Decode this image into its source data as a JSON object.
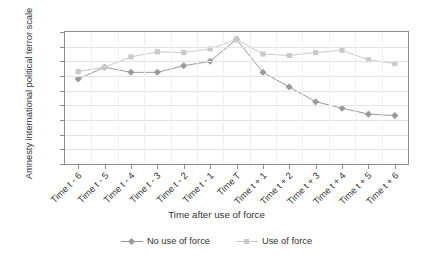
{
  "chart_data": {
    "type": "line",
    "title": "",
    "xlabel": "Time after use of force",
    "ylabel": "Amnesty international political terror scale",
    "ylim": [
      2,
      3.8
    ],
    "yticks": [
      "2",
      "2.2",
      "2.4",
      "2.6",
      "2.8",
      "3",
      "3.2",
      "3.4",
      "3.6",
      "3.8"
    ],
    "grid": true,
    "legend_position": "bottom",
    "categories": [
      "Time t - 6",
      "Time t - 5",
      "Time t - 4",
      "Time t - 3",
      "Time t - 2",
      "Time t - 1",
      "Time T",
      "Time t + 1",
      "Time t + 2",
      "Time t + 3",
      "Time t + 4",
      "Time t + 5",
      "Time t + 6"
    ],
    "series": [
      {
        "name": "No use of force",
        "marker": "diamond",
        "color": "#9a9a9a",
        "values": [
          3.16,
          3.32,
          3.25,
          3.25,
          3.34,
          3.4,
          3.7,
          3.25,
          3.05,
          2.85,
          2.76,
          2.68,
          2.66
        ]
      },
      {
        "name": "Use of force",
        "marker": "square",
        "color": "#c9c9c9",
        "values": [
          3.26,
          3.32,
          3.46,
          3.53,
          3.52,
          3.57,
          3.7,
          3.5,
          3.48,
          3.52,
          3.55,
          3.42,
          3.37
        ]
      }
    ]
  },
  "axis": {
    "y_title": "Amnesty international political terror scale",
    "x_title": "Time after use of force"
  },
  "legend": {
    "items": [
      {
        "label": "No use of force"
      },
      {
        "label": "Use of force"
      }
    ]
  }
}
